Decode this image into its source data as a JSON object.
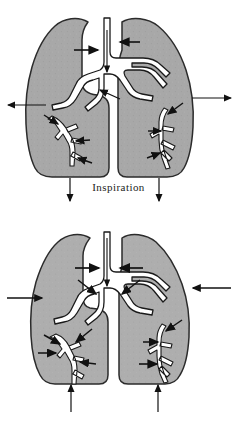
{
  "figure": {
    "background_color": "#ffffff",
    "width": 237,
    "height": 424
  },
  "style": {
    "lung_fill": "#a8a8a8",
    "lung_fill_light": "#b4b4b4",
    "lung_outline": "#2b2b2b",
    "airway_fill": "#ffffff",
    "airway_outline": "#1a1a1a",
    "arrow_color": "#111111",
    "caption_color": "#1c1c1c"
  },
  "panels": [
    {
      "id": "inspiration",
      "caption": "Inspiration",
      "description": "Lungs expanded; chest wall moves outward and diaphragm moves downward; air flows in through the trachea.",
      "lung_state": "expanded",
      "arrows": {
        "chest_wall_left": {
          "label": "chest wall expands outward",
          "direction": "left"
        },
        "chest_wall_right": {
          "label": "chest wall expands outward",
          "direction": "right"
        },
        "diaphragm_left": {
          "label": "diaphragm descends",
          "direction": "down"
        },
        "diaphragm_right": {
          "label": "diaphragm descends",
          "direction": "down"
        },
        "trachea": {
          "label": "air flows in",
          "direction": "down"
        },
        "hilum_left": {
          "label": "airflow into left lung",
          "direction": "right"
        },
        "hilum_right": {
          "label": "airflow into right lung",
          "direction": "left"
        },
        "bronchiole_count": 5
      }
    },
    {
      "id": "expiration",
      "caption": "Expiration",
      "description": "Lungs recoil; chest wall moves inward and diaphragm moves upward; air flows out through the trachea.",
      "lung_state": "contracted",
      "arrows": {
        "chest_wall_left": {
          "label": "chest wall recoils inward",
          "direction": "right"
        },
        "chest_wall_right": {
          "label": "chest wall recoils inward",
          "direction": "left"
        },
        "diaphragm_left": {
          "label": "diaphragm ascends",
          "direction": "up"
        },
        "diaphragm_right": {
          "label": "diaphragm ascends",
          "direction": "up"
        },
        "trachea": {
          "label": "air flows out",
          "direction": "down"
        },
        "hilum_left": {
          "label": "airflow out of left lung",
          "direction": "right"
        },
        "hilum_right": {
          "label": "airflow out of right lung",
          "direction": "left"
        },
        "bronchiole_count": 6
      }
    }
  ]
}
